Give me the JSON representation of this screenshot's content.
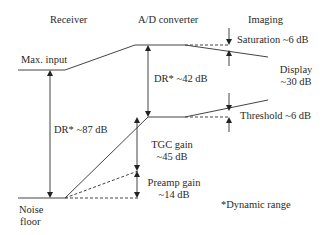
{
  "headers": {
    "receiver": "Receiver",
    "ad_converter": "A/D converter",
    "imaging": "Imaging"
  },
  "labels": {
    "max_input": "Max. input",
    "noise_floor_line1": "Noise",
    "noise_floor_line2": "floor",
    "dr_receiver": "DR* ~87 dB",
    "dr_ad": "DR* ~42 dB",
    "saturation": "Saturation ~6 dB",
    "display_line1": "Display",
    "display_line2": "~30 dB",
    "threshold": "Threshold ~6 dB",
    "tgc_line1": "TGC gain",
    "tgc_line2": "~45 dB",
    "preamp_line1": "Preamp gain",
    "preamp_line2": "~14 dB",
    "footnote": "*Dynamic range"
  },
  "colors": {
    "line": "#333333",
    "text": "#2a2a2a"
  }
}
